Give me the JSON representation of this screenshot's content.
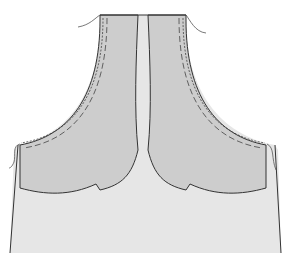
{
  "diagram": {
    "type": "sewing-pattern",
    "colors": {
      "background": "#ffffff",
      "garment": "#e6e6e6",
      "facing": "#cdcdcd",
      "outline": "#333333",
      "stitch": "#444444",
      "thread": "#555555"
    },
    "parts": [
      {
        "id": "garment-body",
        "label": ""
      },
      {
        "id": "facing-left",
        "label": ""
      },
      {
        "id": "facing-right",
        "label": ""
      }
    ]
  }
}
